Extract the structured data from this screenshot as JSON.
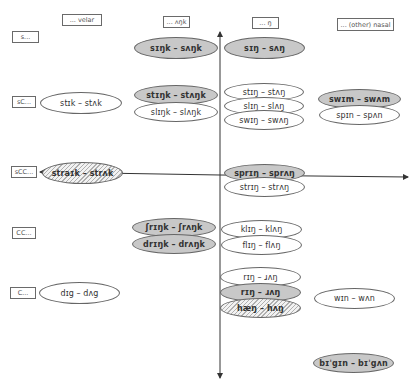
{
  "column_headers": [
    {
      "id": "velar",
      "label": "... velar"
    },
    {
      "id": "ank",
      "label": "... ʌŋk"
    },
    {
      "id": "ng",
      "label": "... ŋ"
    },
    {
      "id": "other_nasal",
      "label": "... (other) nasal"
    }
  ],
  "row_labels": [
    {
      "id": "s",
      "label": "s..."
    },
    {
      "id": "sC",
      "label": "sC..."
    },
    {
      "id": "sCC",
      "label": "sCC..."
    },
    {
      "id": "CC",
      "label": "CC..."
    },
    {
      "id": "C",
      "label": "C..."
    }
  ],
  "items": [
    {
      "id": "sink",
      "text": "sɪŋk – sʌŋk",
      "fill": "grey"
    },
    {
      "id": "sing",
      "text": "sɪŋ – sʌŋ",
      "fill": "grey"
    },
    {
      "id": "stick",
      "text": "stɪk – stʌk",
      "fill": "white"
    },
    {
      "id": "stink",
      "text": "stɪŋk – stʌŋk",
      "fill": "grey"
    },
    {
      "id": "slink",
      "text": "slɪŋk – slʌŋk",
      "fill": "white"
    },
    {
      "id": "sting",
      "text": "stɪŋ – stʌŋ",
      "fill": "white"
    },
    {
      "id": "sling",
      "text": "slɪŋ – slʌŋ",
      "fill": "white"
    },
    {
      "id": "swing",
      "text": "swɪŋ – swʌŋ",
      "fill": "white"
    },
    {
      "id": "swim",
      "text": "swɪm – swʌm",
      "fill": "grey"
    },
    {
      "id": "spin",
      "text": "spɪn – spʌn",
      "fill": "white"
    },
    {
      "id": "strike",
      "text": "straɪk – strʌk",
      "fill": "hatch"
    },
    {
      "id": "spring",
      "text": "sprɪŋ – sprʌŋ",
      "fill": "grey"
    },
    {
      "id": "string",
      "text": "strɪŋ – strʌŋ",
      "fill": "white"
    },
    {
      "id": "shrink",
      "text": "ʃrɪŋk – ʃrʌŋk",
      "fill": "grey"
    },
    {
      "id": "drink",
      "text": "drɪŋk – drʌŋk",
      "fill": "grey"
    },
    {
      "id": "cling",
      "text": "klɪŋ – klʌŋ",
      "fill": "white"
    },
    {
      "id": "fling",
      "text": "flɪŋ – flʌŋ",
      "fill": "white"
    },
    {
      "id": "dig",
      "text": "dɪg – dʌg",
      "fill": "white"
    },
    {
      "id": "wring",
      "text": "rɪŋ – ɹʌŋ",
      "fill": "white"
    },
    {
      "id": "ring",
      "text": "rɪŋ – ɹʌŋ",
      "fill": "grey"
    },
    {
      "id": "hang",
      "text": "hæŋ – hʌŋ",
      "fill": "hatch"
    },
    {
      "id": "win",
      "text": "wɪn – wʌn",
      "fill": "white"
    },
    {
      "id": "begin",
      "text": "bɪˈgɪn – bɪˈgʌn",
      "fill": "grey"
    }
  ],
  "colors": {
    "grey_fill": "#c8c8c8",
    "white_fill": "#ffffff",
    "outline": "#666666",
    "axis": "#333333"
  }
}
